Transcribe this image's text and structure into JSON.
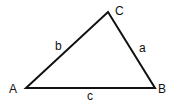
{
  "diagram": {
    "type": "triangle",
    "vertices": [
      {
        "label": "A",
        "x": 26,
        "y": 88
      },
      {
        "label": "B",
        "x": 155,
        "y": 88
      },
      {
        "label": "C",
        "x": 108,
        "y": 12
      }
    ],
    "sides": [
      {
        "label": "a",
        "between": "B-C"
      },
      {
        "label": "b",
        "between": "A-C"
      },
      {
        "label": "c",
        "between": "A-B"
      }
    ],
    "stroke_color": "#111111"
  }
}
